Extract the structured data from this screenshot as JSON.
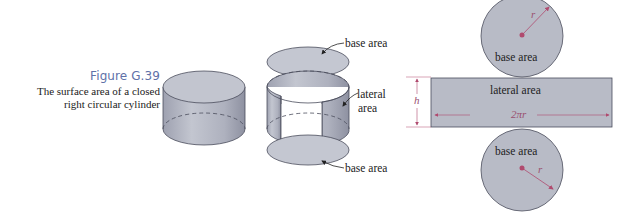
{
  "figure": {
    "title": "Figure G.39",
    "description_line1": "The surface area of a closed",
    "description_line2": "right circular cylinder"
  },
  "exploded_labels": {
    "top_base": "base area",
    "lateral_line1": "lateral",
    "lateral_line2": "area",
    "bottom_base": "base area"
  },
  "net_labels": {
    "top_circle": "base area",
    "rectangle": "lateral area",
    "bottom_circle": "base area",
    "radius_top": "r",
    "radius_bottom": "r",
    "height": "h",
    "circumference": "2πr"
  },
  "colors": {
    "fill": "#b4b7c3",
    "stroke": "#4a4d5c",
    "accent": "#b04a6e",
    "title": "#5e71a8"
  }
}
